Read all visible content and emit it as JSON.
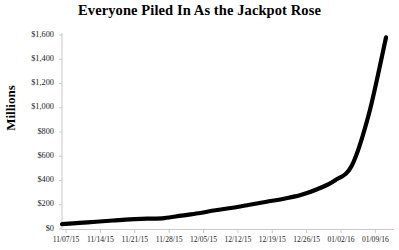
{
  "chart_data": {
    "type": "line",
    "title": "Everyone Piled In As the Jackpot Rose",
    "xlabel": "",
    "ylabel": "Millions",
    "grid": false,
    "legend": null,
    "ylim": [
      0,
      1600
    ],
    "ytick_values": [
      0,
      200,
      400,
      600,
      800,
      1000,
      1200,
      1400,
      1600
    ],
    "ytick_labels": [
      "$0",
      "$200",
      "$400",
      "$600",
      "$800",
      "$1,000",
      "$1,200",
      "$1,400",
      "$1,600"
    ],
    "xtick_labels": [
      "11/07/15",
      "11/14/15",
      "11/21/15",
      "11/28/15",
      "12/05/15",
      "12/12/15",
      "12/19/15",
      "12/26/15",
      "01/02/16",
      "01/09/16"
    ],
    "x": [
      "11/07/15",
      "11/10/15",
      "11/14/15",
      "11/18/15",
      "11/21/15",
      "11/25/15",
      "11/28/15",
      "12/02/15",
      "12/05/15",
      "12/09/15",
      "12/12/15",
      "12/16/15",
      "12/19/15",
      "12/23/15",
      "12/26/15",
      "12/30/15",
      "01/02/16",
      "01/06/16",
      "01/09/16",
      "01/13/16"
    ],
    "values": [
      40,
      50,
      60,
      70,
      80,
      85,
      90,
      110,
      130,
      155,
      175,
      200,
      225,
      250,
      280,
      330,
      400,
      524,
      950,
      1580
    ],
    "series": [
      {
        "name": "Jackpot",
        "color": "#000000",
        "values": [
          40,
          50,
          60,
          70,
          80,
          85,
          90,
          110,
          130,
          155,
          175,
          200,
          225,
          250,
          280,
          330,
          400,
          524,
          950,
          1580
        ]
      }
    ],
    "axis_color": "#c8c8c8",
    "line_color": "#000000",
    "line_width": 4.2
  }
}
